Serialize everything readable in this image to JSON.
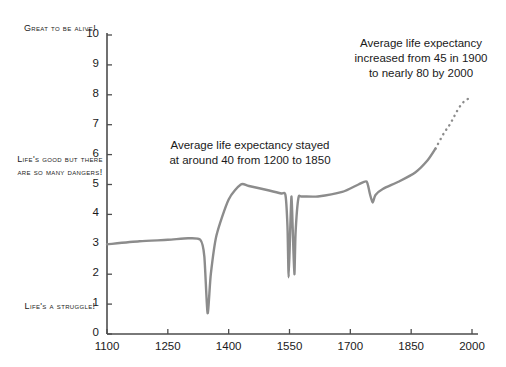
{
  "chart_data": {
    "type": "line",
    "title": "",
    "xlabel": "",
    "ylabel": "",
    "xlim": [
      1100,
      2000
    ],
    "ylim": [
      0,
      10
    ],
    "grid": false,
    "legend": "none",
    "line_color": "#8c8c8c",
    "xticks": [
      "1100",
      "1250",
      "1400",
      "1550",
      "1700",
      "1850",
      "2000"
    ],
    "yticks": [
      "0",
      "1",
      "2",
      "3",
      "4",
      "5",
      "6",
      "7",
      "8",
      "9",
      "10"
    ],
    "series": [
      {
        "name": "Quality of life (solid, historical)",
        "style": "solid",
        "x": [
          1100,
          1180,
          1250,
          1300,
          1330,
          1340,
          1348,
          1356,
          1370,
          1400,
          1430,
          1450,
          1500,
          1530,
          1540,
          1545,
          1548,
          1552,
          1555,
          1558,
          1562,
          1565,
          1572,
          1580,
          1620,
          1680,
          1720,
          1740,
          1748,
          1755,
          1762,
          1780,
          1820,
          1860,
          1890,
          1910
        ],
        "y": [
          3.0,
          3.1,
          3.15,
          3.2,
          3.15,
          2.6,
          0.7,
          2.0,
          3.3,
          4.5,
          5.0,
          4.95,
          4.8,
          4.7,
          4.65,
          3.6,
          1.9,
          3.6,
          4.6,
          3.5,
          2.0,
          3.4,
          4.55,
          4.6,
          4.6,
          4.75,
          5.0,
          5.1,
          4.7,
          4.4,
          4.65,
          4.85,
          5.1,
          5.4,
          5.8,
          6.2
        ]
      },
      {
        "name": "Projection (dotted, modern)",
        "style": "dotted",
        "x": [
          1910,
          1930,
          1945,
          1955,
          1965,
          1975,
          1985,
          1995,
          2000
        ],
        "y": [
          6.2,
          6.7,
          7.0,
          7.25,
          7.5,
          7.7,
          7.82,
          7.9,
          7.92
        ]
      }
    ],
    "mood_labels": [
      {
        "id": "top",
        "text": "Great to be alive!",
        "y_value": 10
      },
      {
        "id": "middle",
        "text": "Life's good but there are so many dangers!",
        "y_value": 5
      },
      {
        "id": "bottom",
        "text": "Life's a struggle!",
        "y_value": 0
      }
    ],
    "annotations": [
      {
        "id": "plateau",
        "text": "Average life expectancy stayed\nat around 40 from 1200 to 1850"
      },
      {
        "id": "modern",
        "text": "Average life expectancy\nincreased from 45 in 1900\nto nearly 80 by 2000"
      }
    ]
  },
  "axis": {
    "color": "#4d4d4d",
    "yticks": [
      "10",
      "9",
      "8",
      "7",
      "6",
      "5",
      "4",
      "3",
      "2",
      "1",
      "0"
    ],
    "xticks": [
      "1100",
      "1250",
      "1400",
      "1550",
      "1700",
      "1850",
      "2000"
    ]
  },
  "labels": {
    "mood_top": "Great to be alive!",
    "mood_middle": "Life's good but there are so many dangers!",
    "mood_bottom": "Life's a struggle!",
    "annotation_plateau": "Average life expectancy stayed\nat around 40 from 1200 to 1850",
    "annotation_modern": "Average life expectancy\nincreased from 45 in 1900\nto nearly 80 by 2000"
  }
}
